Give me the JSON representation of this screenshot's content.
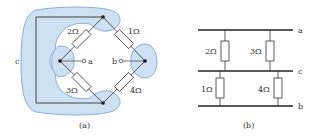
{
  "colors": {
    "region_fill": "#cfe0f2",
    "region_stroke": "#6f9fcf",
    "wire": "#333333",
    "bus": "#222222",
    "resistor_fill": "#ffffff"
  },
  "panel_a": {
    "caption": "(a)",
    "node_c_label": "c",
    "terminal_a_label": "a",
    "terminal_b_label": "b",
    "resistors": [
      {
        "label": "2Ω",
        "position": "upper-left"
      },
      {
        "label": "1Ω",
        "position": "upper-right"
      },
      {
        "label": "3Ω",
        "position": "lower-left"
      },
      {
        "label": "4Ω",
        "position": "lower-right"
      }
    ]
  },
  "panel_b": {
    "caption": "(b)",
    "buses": [
      {
        "label": "a",
        "position": "top"
      },
      {
        "label": "c",
        "position": "middle"
      },
      {
        "label": "b",
        "position": "bottom"
      }
    ],
    "upper_resistors": [
      {
        "label": "2Ω"
      },
      {
        "label": "3Ω"
      }
    ],
    "lower_resistors": [
      {
        "label": "1Ω"
      },
      {
        "label": "4Ω"
      }
    ]
  }
}
